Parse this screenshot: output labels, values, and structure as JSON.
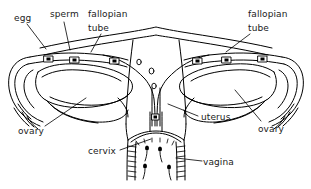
{
  "diagram": {
    "style": "black-and-white line drawing",
    "background_color": "#ffffff",
    "ink_color": "#000000",
    "labels": [
      {
        "id": "egg",
        "text": "egg",
        "x": 14,
        "y": 13,
        "leader": [
          [
            27,
            24
          ],
          [
            46,
            44
          ]
        ]
      },
      {
        "id": "sperm",
        "text": "sperm",
        "x": 50,
        "y": 9,
        "leader": [
          [
            64,
            20
          ],
          [
            72,
            47
          ]
        ]
      },
      {
        "id": "fallopian-left",
        "text": "fallopian",
        "x": 88,
        "y": 9,
        "leader": [
          [
            101,
            32
          ],
          [
            90,
            50
          ]
        ]
      },
      {
        "id": "tube-left",
        "text": "tube",
        "x": 88,
        "y": 23,
        "leader": []
      },
      {
        "id": "fallopian-right",
        "text": "fallopian",
        "x": 248,
        "y": 9,
        "leader": [
          [
            250,
            32
          ],
          [
            224,
            51
          ]
        ]
      },
      {
        "id": "tube-right",
        "text": "tube",
        "x": 248,
        "y": 23,
        "leader": []
      },
      {
        "id": "ovary-left",
        "text": "ovary",
        "x": 18,
        "y": 126,
        "leader": [
          [
            45,
            126
          ],
          [
            84,
            99
          ]
        ]
      },
      {
        "id": "ovary-right",
        "text": "ovary",
        "x": 258,
        "y": 124,
        "leader": [
          [
            262,
            121
          ],
          [
            234,
            90
          ]
        ]
      },
      {
        "id": "uterus",
        "text": "uterus",
        "x": 201,
        "y": 112,
        "leader": [
          [
            199,
            116
          ],
          [
            168,
            104
          ]
        ]
      },
      {
        "id": "cervix",
        "text": "cervix",
        "x": 88,
        "y": 146,
        "leader": [
          [
            121,
            150
          ],
          [
            150,
            140
          ]
        ]
      },
      {
        "id": "vagina",
        "text": "vagina",
        "x": 203,
        "y": 157,
        "leader": [
          [
            201,
            161
          ],
          [
            173,
            158
          ]
        ]
      }
    ],
    "structures": [
      "uterus-body",
      "uterine-cavity",
      "fundus",
      "fallopian-tube-left",
      "fallopian-tube-right",
      "fimbriae-left",
      "fimbriae-right",
      "ovary-left",
      "ovary-right",
      "cervix",
      "vagina",
      "vaginal-rugae",
      "egg-markers",
      "sperm-markers"
    ]
  }
}
